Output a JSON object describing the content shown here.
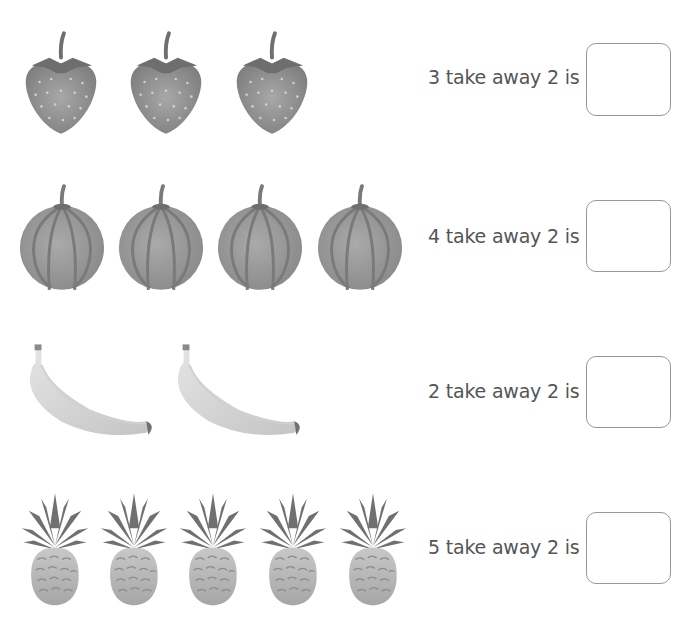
{
  "worksheet": {
    "questions": [
      {
        "fruit": "strawberry",
        "count": 3,
        "text": "3 take away 2 is",
        "answer": ""
      },
      {
        "fruit": "melon",
        "count": 4,
        "text": "4 take away 2 is",
        "answer": ""
      },
      {
        "fruit": "banana",
        "count": 2,
        "text": "2 take away 2 is",
        "answer": ""
      },
      {
        "fruit": "pineapple",
        "count": 5,
        "text": "5 take away 2 is",
        "answer": ""
      }
    ]
  },
  "colors": {
    "text": "#555555",
    "box_border": "#999999",
    "fruit_dark": "#7a7a7a",
    "fruit_mid": "#9a9a9a",
    "fruit_light": "#c8c8c8"
  }
}
